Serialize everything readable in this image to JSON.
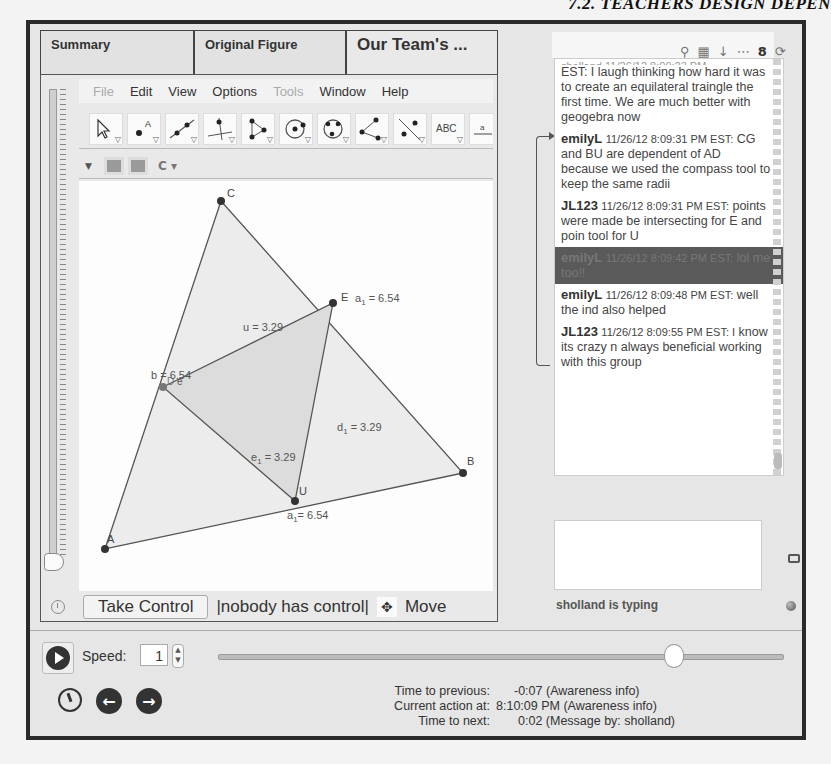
{
  "page_header": "7.2. TEACHERS DESIGN DEPEN",
  "tabs": [
    {
      "label": "Summary"
    },
    {
      "label": "Original Figure"
    },
    {
      "label": "Our Team's ...",
      "active": true
    }
  ],
  "menu": [
    {
      "label": "File",
      "disabled": true
    },
    {
      "label": "Edit"
    },
    {
      "label": "View"
    },
    {
      "label": "Options"
    },
    {
      "label": "Tools",
      "disabled": true
    },
    {
      "label": "Window"
    },
    {
      "label": "Help"
    }
  ],
  "toolbar": {
    "tools": [
      {
        "name": "move-tool-icon"
      },
      {
        "name": "point-tool-icon"
      },
      {
        "name": "line-tool-icon"
      },
      {
        "name": "perpendicular-tool-icon"
      },
      {
        "name": "polygon-tool-icon"
      },
      {
        "name": "circle-center-tool-icon"
      },
      {
        "name": "circle-three-points-tool-icon"
      },
      {
        "name": "angle-tool-icon"
      },
      {
        "name": "reflect-tool-icon"
      },
      {
        "name": "text-tool-icon",
        "label": "ABC"
      },
      {
        "name": "slider-tool-icon",
        "label": "a"
      }
    ]
  },
  "figure": {
    "points": [
      {
        "label": "C"
      },
      {
        "label": "A"
      },
      {
        "label": "B"
      },
      {
        "label": "E"
      },
      {
        "label": "U"
      },
      {
        "label": "D"
      },
      {
        "label": "e"
      }
    ],
    "labels": {
      "a1_right": "a",
      "a1_right_sub": "1",
      "a1_right_val": " = 6.54",
      "u": "u = 3.29",
      "b": "b = 6.54",
      "d1": "d",
      "d1_sub": "1",
      "d1_val": " = 3.29",
      "e1": "e",
      "e1_sub": "1",
      "e1_val": " = 3.29",
      "a1_bottom": "a",
      "a1_bottom_sub": "1",
      "a1_bottom_val": "= 6.54"
    }
  },
  "bottom_bar": {
    "take_control": "Take Control",
    "control_status": "|nobody has control|",
    "move_label": "Move"
  },
  "chat": {
    "messages": [
      {
        "user": "",
        "timestamp": "",
        "text": "EST: I laugh thinking how hard it was to create an equilateral traingle the first time. We are much better with geogebra now",
        "partial": true
      },
      {
        "user": "emilyL",
        "timestamp": "11/26/12 8:09:31 PM EST:",
        "text": "CG and BU are dependent of AD because we used the compass tool to keep the same radii"
      },
      {
        "user": "JL123",
        "timestamp": "11/26/12 8:09:31 PM EST:",
        "text": "points were made be intersecting for E and poin tool for U"
      },
      {
        "user": "emilyL",
        "timestamp": "11/26/12 8:09:42 PM EST:",
        "text": "lol me too!!",
        "highlight": true
      },
      {
        "user": "emilyL",
        "timestamp": "11/26/12 8:09:48 PM EST:",
        "text": "well the ind also helped"
      },
      {
        "user": "JL123",
        "timestamp": "11/26/12 8:09:55 PM EST: I",
        "text": "know its crazy n always beneficial working with this group"
      }
    ],
    "typing_status": "sholland is typing",
    "input_value": ""
  },
  "playback": {
    "speed_label": "Speed:",
    "speed_value": "1",
    "time_info": [
      {
        "label": "Time to previous:",
        "value": "-0:07 (Awareness info)"
      },
      {
        "label": "Current action at:",
        "value": "8:10:09 PM (Awareness info)"
      },
      {
        "label": "Time to next:",
        "value": "0:02 (Message by: sholland)"
      }
    ]
  }
}
